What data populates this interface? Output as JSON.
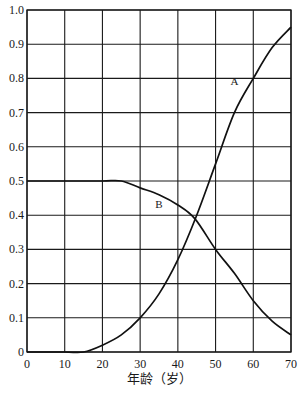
{
  "chart_data": {
    "type": "line",
    "title": "",
    "xlabel": "年龄（岁）",
    "ylabel": "",
    "xlim": [
      0,
      70
    ],
    "ylim": [
      0,
      1.0
    ],
    "grid": true,
    "legend": "inline curve labels",
    "x_ticks": [
      "0",
      "10",
      "20",
      "30",
      "40",
      "50",
      "60",
      "70"
    ],
    "y_ticks": [
      "0",
      "0.1",
      "0.2",
      "0.3",
      "0.4",
      "0.5",
      "0.6",
      "0.7",
      "0.8",
      "0.9",
      "1.0"
    ],
    "series": [
      {
        "name": "A",
        "label_position": {
          "x": 55,
          "y": 0.78
        },
        "points": [
          [
            0,
            0
          ],
          [
            10,
            0
          ],
          [
            15,
            0
          ],
          [
            20,
            0.02
          ],
          [
            25,
            0.05
          ],
          [
            30,
            0.1
          ],
          [
            35,
            0.17
          ],
          [
            40,
            0.27
          ],
          [
            45,
            0.4
          ],
          [
            50,
            0.55
          ],
          [
            55,
            0.7
          ],
          [
            60,
            0.8
          ],
          [
            65,
            0.89
          ],
          [
            70,
            0.95
          ]
        ]
      },
      {
        "name": "B",
        "label_position": {
          "x": 35,
          "y": 0.42
        },
        "points": [
          [
            0,
            0.5
          ],
          [
            10,
            0.5
          ],
          [
            20,
            0.5
          ],
          [
            25,
            0.5
          ],
          [
            30,
            0.48
          ],
          [
            35,
            0.46
          ],
          [
            40,
            0.43
          ],
          [
            44.5,
            0.39
          ],
          [
            50,
            0.3
          ],
          [
            55,
            0.23
          ],
          [
            60,
            0.15
          ],
          [
            65,
            0.09
          ],
          [
            70,
            0.05
          ]
        ]
      }
    ]
  }
}
